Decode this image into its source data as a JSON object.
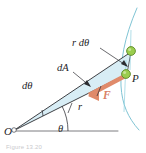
{
  "figure": {
    "kind": "physics-diagram",
    "caption": "Figure 13.20",
    "background_color": "#ffffff"
  },
  "labels": {
    "arc_length": "r dθ",
    "area_element": "dA",
    "angle_element": "dθ",
    "radius": "r",
    "angle": "θ",
    "force": "F",
    "point_p": "P",
    "origin": "O"
  },
  "colors": {
    "sector_fill": "#d6ecf4",
    "sector_edge": "#2b2b30",
    "orbit_arc": "#7fc4d4",
    "radial_line": "#8fd0de",
    "force_arrow": "#e08a6a",
    "particle_dot_fill": "#8cc63f",
    "particle_dot_edge": "#4f7a22",
    "axis_line": "#6e6e73",
    "label_text": "#242428",
    "caption_text": "#c9c9cc"
  },
  "geometry": {
    "origin_point": {
      "x": 13,
      "y": 131
    },
    "point_p": {
      "x": 127,
      "y": 74
    },
    "point_q": {
      "x": 131,
      "y": 52
    },
    "axis_end": {
      "x": 118,
      "y": 131
    },
    "theta_degrees": 26,
    "dtheta_degrees": 11
  },
  "elements": [
    {
      "name": "swept-area-sector",
      "label": "dA",
      "interactable": false
    },
    {
      "name": "orbit-arc",
      "label": "",
      "interactable": false
    },
    {
      "name": "force-vector",
      "label": "F",
      "interactable": false
    },
    {
      "name": "particle-dot-p",
      "label": "P",
      "interactable": false
    },
    {
      "name": "particle-dot-q",
      "label": "",
      "interactable": false
    },
    {
      "name": "reference-axis",
      "label": "",
      "interactable": false
    }
  ]
}
